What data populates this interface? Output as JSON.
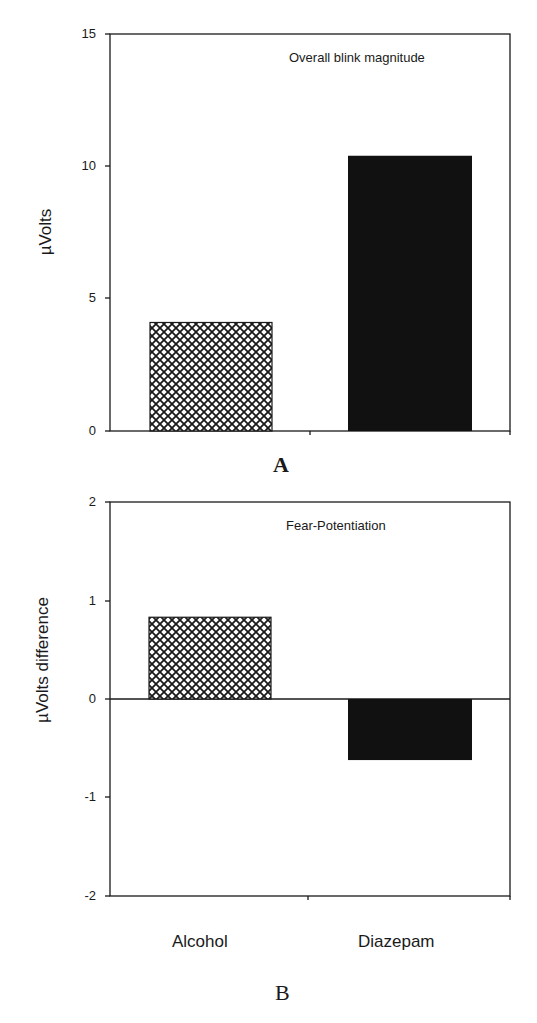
{
  "chart_data": [
    {
      "type": "bar",
      "panel": "A",
      "title": "Overall blink magnitude",
      "ylabel": "µVolts",
      "xlabel": "",
      "categories": [
        "Alcohol",
        "Diazepam"
      ],
      "values": [
        4.1,
        10.4
      ],
      "ylim": [
        0,
        15
      ],
      "yticks": [
        "0",
        "5",
        "10",
        "15"
      ],
      "grid": false,
      "legend": null,
      "bar_styles": [
        "crosshatch",
        "solid-black"
      ]
    },
    {
      "type": "bar",
      "panel": "B",
      "title": "Fear-Potentiation",
      "ylabel": "µVolts difference",
      "xlabel": "",
      "categories": [
        "Alcohol",
        "Diazepam"
      ],
      "values": [
        0.83,
        -0.62
      ],
      "ylim": [
        -2,
        2
      ],
      "yticks": [
        "-2",
        "-1",
        "0",
        "1",
        "2"
      ],
      "grid": false,
      "legend": null,
      "bar_styles": [
        "crosshatch",
        "solid-black"
      ]
    }
  ],
  "panelA": {
    "title": "Overall blink magnitude",
    "ylabel": "µVolts",
    "letter": "A",
    "ticks": [
      "15",
      "10",
      "5",
      "0"
    ]
  },
  "panelB": {
    "title": "Fear-Potentiation",
    "ylabel": "µVolts difference",
    "letter": "B",
    "ticks": [
      "2",
      "1",
      "0",
      "-1",
      "-2"
    ],
    "categories": [
      "Alcohol",
      "Diazepam"
    ]
  },
  "colors": {
    "axis": "#1a1a1a",
    "solid_bar": "#111111",
    "hatch": "#1a1a1a",
    "background": "#ffffff"
  }
}
